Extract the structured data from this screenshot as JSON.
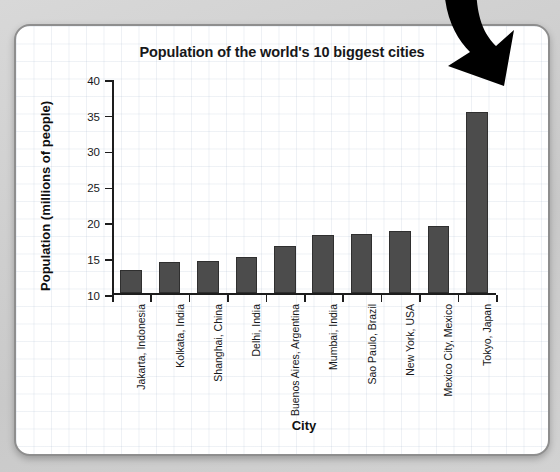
{
  "chart_data": {
    "type": "bar",
    "title": "Population of the world's 10 biggest cities",
    "xlabel": "City",
    "ylabel": "Population (millions of people)",
    "categories": [
      "Jakarta, Indonesia",
      "Kolkata, India",
      "Shanghai, China",
      "Delhi, India",
      "Buenos Aires, Argentina",
      "Mumbai, India",
      "Sao Paulo, Brazil",
      "New York, USA",
      "Mexico City, Mexico",
      "Tokyo, Japan"
    ],
    "values": [
      13.2,
      14.3,
      14.5,
      15.0,
      16.6,
      18.1,
      18.2,
      18.6,
      19.4,
      35.2
    ],
    "ylim": [
      10,
      40
    ],
    "yticks": [
      10,
      15,
      20,
      25,
      30,
      35,
      40
    ],
    "ytick_labels": [
      "10",
      "15",
      "20",
      "25",
      "30",
      "35",
      "40"
    ],
    "grid": true,
    "legend": "none",
    "bar_color": "#4c4c4c",
    "axis_color": "#1d1d1d"
  },
  "annotation": {
    "arrow_name": "curved-down-arrow",
    "arrow_color": "#000000"
  },
  "card": {
    "background_color": "#ffffff",
    "border_color": "#8e8e8e"
  },
  "page": {
    "background_color": "#d2d2d2"
  }
}
